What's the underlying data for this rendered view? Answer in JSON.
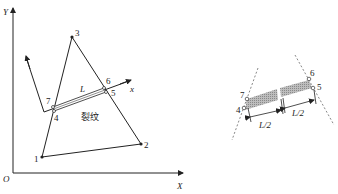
{
  "left_figure": {
    "global_axes": {
      "y_label": "Y",
      "x_label": "X",
      "origin_label": "O"
    },
    "local_axis_x_label": "x",
    "nodes": [
      {
        "id": "1",
        "label": "1"
      },
      {
        "id": "2",
        "label": "2"
      },
      {
        "id": "3",
        "label": "3"
      },
      {
        "id": "4",
        "label": "4"
      },
      {
        "id": "5",
        "label": "5"
      },
      {
        "id": "6",
        "label": "6"
      },
      {
        "id": "7",
        "label": "7"
      }
    ],
    "crack_length_label": "L",
    "crack_label": "裂纹"
  },
  "right_figure": {
    "nodes": [
      {
        "id": "4",
        "label": "4"
      },
      {
        "id": "5",
        "label": "5"
      },
      {
        "id": "6",
        "label": "6"
      },
      {
        "id": "7",
        "label": "7"
      }
    ],
    "half_length_left": "L/2",
    "half_length_right": "L/2"
  },
  "colors": {
    "line": "#222222",
    "hatch": "#9a9a9a",
    "dash": "#888888"
  }
}
